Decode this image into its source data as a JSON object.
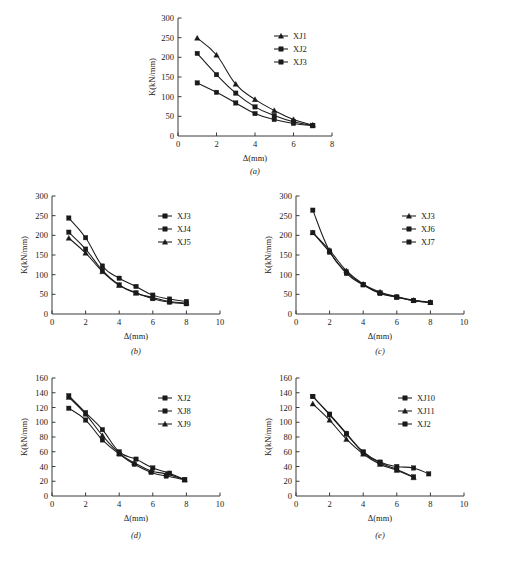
{
  "figure": {
    "panels": [
      {
        "id": "a",
        "label": "(a)"
      },
      {
        "id": "b",
        "label": "(b)"
      },
      {
        "id": "c",
        "label": "(c)"
      },
      {
        "id": "d",
        "label": "(d)"
      },
      {
        "id": "e",
        "label": "(e)"
      }
    ],
    "xlabel": "Δ(mm)",
    "ylabel": "K(kN/mm)"
  },
  "chart_data": [
    {
      "type": "line",
      "panel": "(a)",
      "title": "",
      "xlabel": "Δ(mm)",
      "ylabel": "K(kN/mm)",
      "xlim": [
        0,
        8
      ],
      "ylim": [
        0,
        300
      ],
      "xticks": [
        0,
        2,
        4,
        6,
        8
      ],
      "yticks": [
        50,
        100,
        150,
        200,
        250,
        300
      ],
      "grid": false,
      "legend_position": "upper-right",
      "series": [
        {
          "name": "XJ1",
          "marker": "triangle",
          "x": [
            1,
            2,
            3,
            4,
            5,
            6,
            7
          ],
          "y": [
            249,
            206,
            132,
            93,
            65,
            42,
            28
          ]
        },
        {
          "name": "XJ2",
          "marker": "square",
          "x": [
            1,
            2,
            3,
            4,
            5,
            6,
            7
          ],
          "y": [
            210,
            156,
            109,
            74,
            52,
            36,
            27
          ]
        },
        {
          "name": "XJ3",
          "marker": "square",
          "x": [
            1,
            2,
            3,
            4,
            5,
            6,
            7
          ],
          "y": [
            135,
            111,
            84,
            57,
            42,
            32,
            26
          ]
        }
      ]
    },
    {
      "type": "line",
      "panel": "(b)",
      "title": "",
      "xlabel": "Δ(mm)",
      "ylabel": "K(kN/mm)",
      "xlim": [
        0,
        10
      ],
      "ylim": [
        0,
        300
      ],
      "xticks": [
        0,
        2,
        4,
        6,
        8,
        10
      ],
      "yticks": [
        50,
        100,
        150,
        200,
        250,
        300
      ],
      "grid": false,
      "legend_position": "upper-right",
      "series": [
        {
          "name": "XJ3",
          "marker": "square",
          "x": [
            1,
            2,
            3,
            4,
            5,
            6,
            7,
            8
          ],
          "y": [
            208,
            165,
            111,
            74,
            54,
            39,
            30,
            26
          ]
        },
        {
          "name": "XJ4",
          "marker": "square",
          "x": [
            1,
            2,
            3,
            4,
            5,
            6,
            7,
            8
          ],
          "y": [
            244,
            194,
            122,
            91,
            70,
            48,
            38,
            32
          ]
        },
        {
          "name": "XJ5",
          "marker": "triangle",
          "x": [
            1,
            2,
            3,
            4,
            5,
            6,
            7,
            8
          ],
          "y": [
            193,
            155,
            108,
            73,
            53,
            42,
            32,
            28
          ]
        }
      ]
    },
    {
      "type": "line",
      "panel": "(c)",
      "title": "",
      "xlabel": "Δ(mm)",
      "ylabel": "K(kN/mm)",
      "xlim": [
        0,
        10
      ],
      "ylim": [
        0,
        300
      ],
      "xticks": [
        0,
        2,
        4,
        6,
        8,
        10
      ],
      "yticks": [
        50,
        100,
        150,
        200,
        250,
        300
      ],
      "grid": false,
      "legend_position": "upper-right",
      "series": [
        {
          "name": "XJ3",
          "marker": "triangle",
          "x": [
            1,
            2,
            3,
            4,
            5,
            6,
            7,
            8
          ],
          "y": [
            207,
            162,
            110,
            76,
            56,
            44,
            35,
            30
          ]
        },
        {
          "name": "XJ6",
          "marker": "square",
          "x": [
            1,
            2,
            3,
            4,
            5,
            6,
            7,
            8
          ],
          "y": [
            207,
            157,
            103,
            74,
            52,
            43,
            34,
            29
          ]
        },
        {
          "name": "XJ7",
          "marker": "square",
          "x": [
            1,
            2,
            3,
            4,
            5,
            6,
            7,
            8
          ],
          "y": [
            264,
            160,
            107,
            75,
            54,
            43,
            34,
            29
          ]
        }
      ]
    },
    {
      "type": "line",
      "panel": "(d)",
      "title": "",
      "xlabel": "Δ(mm)",
      "ylabel": "K(kN/mm)",
      "xlim": [
        0,
        10
      ],
      "ylim": [
        0,
        160
      ],
      "xticks": [
        0,
        2,
        4,
        6,
        8,
        10
      ],
      "yticks": [
        20,
        40,
        60,
        80,
        100,
        120,
        140,
        160
      ],
      "grid": false,
      "legend_position": "upper-right",
      "series": [
        {
          "name": "XJ2",
          "marker": "square",
          "x": [
            1,
            2,
            3,
            4,
            5,
            6,
            7,
            7.9
          ],
          "y": [
            136,
            113,
            90,
            60,
            50,
            38,
            31,
            22
          ]
        },
        {
          "name": "XJ8",
          "marker": "square",
          "x": [
            1,
            2,
            3,
            4,
            4.9,
            5.9,
            6.8,
            7.9
          ],
          "y": [
            119,
            103,
            76,
            57,
            43,
            32,
            27,
            22
          ]
        },
        {
          "name": "XJ9",
          "marker": "triangle",
          "x": [
            1,
            2,
            3,
            4,
            4.9,
            5.9,
            6.8,
            7.9
          ],
          "y": [
            134,
            111,
            82,
            58,
            45,
            34,
            30,
            22
          ]
        }
      ]
    },
    {
      "type": "line",
      "panel": "(e)",
      "title": "",
      "xlabel": "Δ(mm)",
      "ylabel": "K(kN/mm)",
      "xlim": [
        0,
        10
      ],
      "ylim": [
        0,
        160
      ],
      "xticks": [
        0,
        2,
        4,
        6,
        8,
        10
      ],
      "yticks": [
        20,
        40,
        60,
        80,
        100,
        120,
        140,
        160
      ],
      "grid": false,
      "legend_position": "upper-right",
      "series": [
        {
          "name": "XJ10",
          "marker": "square",
          "x": [
            1,
            2,
            3,
            4,
            5,
            6,
            7,
            7.9
          ],
          "y": [
            135,
            111,
            85,
            60,
            46,
            40,
            38,
            30
          ]
        },
        {
          "name": "XJ11",
          "marker": "triangle",
          "x": [
            1,
            2,
            3,
            4,
            5,
            6,
            7
          ],
          "y": [
            125,
            103,
            77,
            57,
            43,
            35,
            25
          ]
        },
        {
          "name": "XJ2",
          "marker": "square",
          "x": [
            1,
            2,
            3,
            4,
            5,
            6,
            7
          ],
          "y": [
            135,
            110,
            84,
            59,
            45,
            36,
            26
          ]
        }
      ]
    }
  ]
}
